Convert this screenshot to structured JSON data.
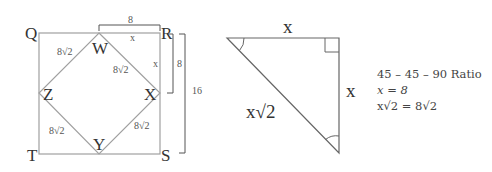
{
  "square_figure": {
    "vertices": {
      "Q": "Q",
      "R": "R",
      "S": "S",
      "T": "T"
    },
    "inner_vertices": {
      "W": "W",
      "X": "X",
      "Y": "Y",
      "Z": "Z"
    },
    "side_labels": {
      "top_left": "8√2",
      "top_right": "8√2",
      "bottom_left": "8√2",
      "bottom_right": "8√2"
    },
    "segment_labels": {
      "wr": "x",
      "rx": "x"
    },
    "dimensions": {
      "top_bracket": "8",
      "right_small_bracket": "8",
      "right_large_bracket": "16"
    }
  },
  "triangle_figure": {
    "top_side": "x",
    "right_side": "x",
    "hypotenuse": "x√2"
  },
  "ratio_notes": {
    "title": "45 – 45 – 90 Ratio",
    "line1": "x = 8",
    "line2": "x√2 = 8√2"
  },
  "colors": {
    "line": "#9a9a9a",
    "bracket": "#555555",
    "text": "#333333"
  }
}
